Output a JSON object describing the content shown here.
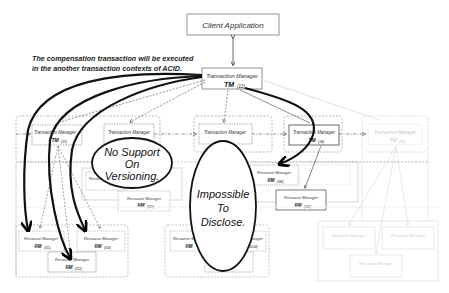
{
  "client": {
    "label": "Client Application"
  },
  "annotation": {
    "line1": "The compensation transaction will be executed",
    "line2": "in the another transaction contexts of ACID."
  },
  "root_tm": {
    "label": "Transaction Manager",
    "name": "TM",
    "sub": "(11)"
  },
  "tms": [
    {
      "label": "Transaction Manager",
      "name": "TM",
      "sub": "(21)"
    },
    {
      "label": "Transaction Manager",
      "name": "",
      "sub": ""
    },
    {
      "label": "Transaction Manager",
      "name": "",
      "sub": ""
    },
    {
      "label": "Transaction Manager",
      "name": "TM",
      "sub": "(24)"
    },
    {
      "label": "Transaction Manager",
      "name": "TM",
      "sub": "(25)"
    }
  ],
  "rms": [
    {
      "label": "Resource Manager",
      "name": "RM",
      "sub": "(311)"
    },
    {
      "label": "Resource Manager",
      "name": "RM",
      "sub": "(314)"
    },
    {
      "label": "Resource Manager",
      "name": "RM",
      "sub": "(312)"
    },
    {
      "label": "Resource Manager",
      "name": "RM",
      "sub": "(322)"
    },
    {
      "label": "Resource Manager",
      "name": "RM",
      "sub": "(323)"
    },
    {
      "label": "Resource Manager",
      "name": "RM",
      "sub": "(341)"
    },
    {
      "label": "Resource Manager",
      "name": "RM",
      "sub": "(342)"
    },
    {
      "label": "Resource Manager",
      "name": "RM",
      "sub": "(331)"
    },
    {
      "label": "Resource Manager",
      "name": "RM",
      "sub": "(33-34)"
    }
  ],
  "callouts": {
    "versioning": [
      "No Support",
      "On",
      "Versioning."
    ],
    "disclose": [
      "Impossible",
      "To",
      "Disclose."
    ]
  }
}
